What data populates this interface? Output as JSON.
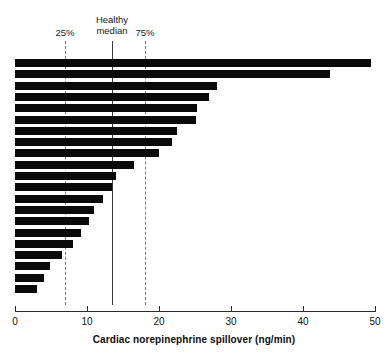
{
  "chart_data": {
    "type": "bar",
    "orientation": "horizontal",
    "title": "",
    "subtitle": "",
    "xlabel": "Cardiac norepinephrine spillover (ng/min)",
    "ylabel": "",
    "xlim": [
      0,
      50
    ],
    "xticks": [
      0,
      10,
      20,
      30,
      40,
      50
    ],
    "xtick_labels": [
      "0",
      "10",
      "20",
      "30",
      "40",
      "50"
    ],
    "grid": false,
    "legend": "none",
    "categories": [
      "patient-1",
      "patient-2",
      "patient-3",
      "patient-4",
      "patient-5",
      "patient-6",
      "patient-7",
      "patient-8",
      "patient-9",
      "patient-10",
      "patient-11",
      "patient-12",
      "patient-13",
      "patient-14",
      "patient-15",
      "patient-16",
      "patient-17",
      "patient-18",
      "patient-19",
      "patient-20",
      "patient-21"
    ],
    "values": [
      49.5,
      43.7,
      28.0,
      27.0,
      25.3,
      25.2,
      22.5,
      21.8,
      20.0,
      16.5,
      14.0,
      13.5,
      12.2,
      11.0,
      10.3,
      9.2,
      8.0,
      6.5,
      4.8,
      4.0,
      3.0
    ],
    "bar_color": "#0a0a0a",
    "annotations": [
      {
        "name": "p25",
        "label": "25%",
        "label_line2": "",
        "value": 7.0,
        "style": "dashed",
        "color": "#7a7a7a"
      },
      {
        "name": "healthy-median",
        "label": "Healthy",
        "label_line2": "median",
        "value": 13.5,
        "style": "solid",
        "color": "#3a3a3a"
      },
      {
        "name": "p75",
        "label": "75%",
        "label_line2": "",
        "value": 18.0,
        "style": "dashed",
        "color": "#7a7a7a"
      }
    ]
  },
  "annotation_labels": {
    "p25": "25%",
    "median_line1": "Healthy",
    "median_line2": "median",
    "p75": "75%"
  },
  "axis": {
    "title": "Cardiac norepinephrine spillover (ng/min)",
    "tick_0": "0",
    "tick_1": "10",
    "tick_2": "20",
    "tick_3": "30",
    "tick_4": "40",
    "tick_5": "50"
  }
}
